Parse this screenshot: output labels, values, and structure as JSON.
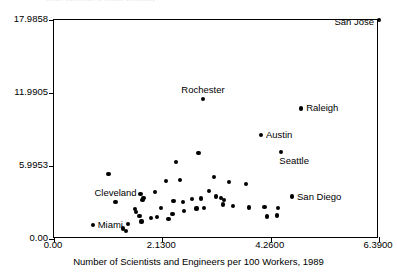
{
  "figure": {
    "clipped_title": "....... ............ .. ........ ...........,",
    "xaxis_title": "Number of Scientists and Engineers per 100 Workers, 1989"
  },
  "chart_data": {
    "type": "scatter",
    "title": "",
    "xlabel": "Number of Scientists and Engineers per 100 Workers, 1989",
    "ylabel": "",
    "xlim": [
      0.0,
      6.39
    ],
    "ylim": [
      0.0,
      17.9858
    ],
    "grid": false,
    "legend": null,
    "xticks": [
      0.0,
      2.13,
      4.26,
      6.39
    ],
    "xticklabels": [
      "0.00",
      "2.1300",
      "4.2600",
      "6.3900"
    ],
    "yticks": [
      0.0,
      5.9953,
      11.9905,
      17.9858
    ],
    "yticklabels": [
      "0.00",
      "5.9953",
      "11.9905",
      "17.9858"
    ],
    "marker": "filled-circle",
    "marker_color": "#000000",
    "points": [
      {
        "label": "San Jose",
        "x": 6.39,
        "y": 17.986,
        "label_pos": "left"
      },
      {
        "label": "Rochester",
        "x": 2.93,
        "y": 11.52,
        "label_pos": "above"
      },
      {
        "label": "Raleigh",
        "x": 4.86,
        "y": 10.72,
        "label_pos": "right"
      },
      {
        "label": "Austin",
        "x": 4.07,
        "y": 8.53,
        "label_pos": "right"
      },
      {
        "label": "Seattle",
        "x": 4.47,
        "y": 7.14,
        "label_pos": "below-right"
      },
      {
        "label": "San Diego",
        "x": 4.68,
        "y": 3.49,
        "label_pos": "right"
      },
      {
        "label": "Cleveland",
        "x": 1.21,
        "y": 3.06,
        "label_pos": "above"
      },
      {
        "label": "Miami",
        "x": 0.76,
        "y": 1.12,
        "label_pos": "right"
      },
      {
        "label": null,
        "x": 1.07,
        "y": 5.35
      },
      {
        "label": null,
        "x": 2.4,
        "y": 6.34
      },
      {
        "label": null,
        "x": 2.84,
        "y": 7.05
      },
      {
        "label": null,
        "x": 3.14,
        "y": 5.12
      },
      {
        "label": null,
        "x": 2.2,
        "y": 4.76
      },
      {
        "label": null,
        "x": 2.48,
        "y": 4.83
      },
      {
        "label": null,
        "x": 3.05,
        "y": 3.94
      },
      {
        "label": null,
        "x": 3.44,
        "y": 4.67
      },
      {
        "label": null,
        "x": 3.77,
        "y": 4.51
      },
      {
        "label": null,
        "x": 1.7,
        "y": 3.7
      },
      {
        "label": null,
        "x": 1.76,
        "y": 3.4
      },
      {
        "label": null,
        "x": 1.74,
        "y": 3.18
      },
      {
        "label": null,
        "x": 1.99,
        "y": 3.83
      },
      {
        "label": null,
        "x": 2.35,
        "y": 3.11
      },
      {
        "label": null,
        "x": 2.54,
        "y": 3.01
      },
      {
        "label": null,
        "x": 2.72,
        "y": 3.26
      },
      {
        "label": null,
        "x": 2.89,
        "y": 3.33
      },
      {
        "label": null,
        "x": 3.19,
        "y": 3.49
      },
      {
        "label": null,
        "x": 3.28,
        "y": 3.38
      },
      {
        "label": null,
        "x": 3.35,
        "y": 3.22
      },
      {
        "label": null,
        "x": 3.32,
        "y": 2.84
      },
      {
        "label": null,
        "x": 3.52,
        "y": 2.72
      },
      {
        "label": null,
        "x": 2.95,
        "y": 2.55
      },
      {
        "label": null,
        "x": 3.83,
        "y": 2.58
      },
      {
        "label": null,
        "x": 4.14,
        "y": 2.62
      },
      {
        "label": null,
        "x": 4.41,
        "y": 2.53
      },
      {
        "label": null,
        "x": 1.59,
        "y": 2.48
      },
      {
        "label": null,
        "x": 1.62,
        "y": 2.19
      },
      {
        "label": null,
        "x": 1.68,
        "y": 1.9
      },
      {
        "label": null,
        "x": 1.72,
        "y": 1.43
      },
      {
        "label": null,
        "x": 1.45,
        "y": 1.2
      },
      {
        "label": null,
        "x": 1.9,
        "y": 1.7
      },
      {
        "label": null,
        "x": 2.02,
        "y": 1.78
      },
      {
        "label": null,
        "x": 2.25,
        "y": 1.63
      },
      {
        "label": null,
        "x": 2.33,
        "y": 2.03
      },
      {
        "label": null,
        "x": 2.56,
        "y": 2.33
      },
      {
        "label": null,
        "x": 2.8,
        "y": 2.5
      },
      {
        "label": null,
        "x": 2.1,
        "y": 2.57
      },
      {
        "label": null,
        "x": 4.38,
        "y": 1.93
      },
      {
        "label": null,
        "x": 4.18,
        "y": 1.85
      },
      {
        "label": null,
        "x": 1.35,
        "y": 0.86
      },
      {
        "label": null,
        "x": 1.42,
        "y": 0.64
      }
    ]
  }
}
